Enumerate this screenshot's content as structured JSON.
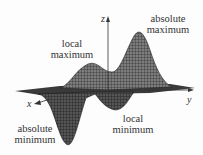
{
  "figure": {
    "axes": {
      "x": "x",
      "y": "y",
      "z": "z"
    },
    "annotations": {
      "absolute_maximum": {
        "line1": "absolute",
        "line2": "maximum"
      },
      "local_maximum": {
        "line1": "local",
        "line2": "maximum"
      },
      "local_minimum": {
        "line1": "local",
        "line2": "minimum"
      },
      "absolute_minimum": {
        "line1": "absolute",
        "line2": "minimum"
      }
    },
    "colors": {
      "surface_dark": "#3a3a3a",
      "surface_light": "#8a8a8a",
      "mesh": "#222222",
      "text": "#333333"
    }
  }
}
